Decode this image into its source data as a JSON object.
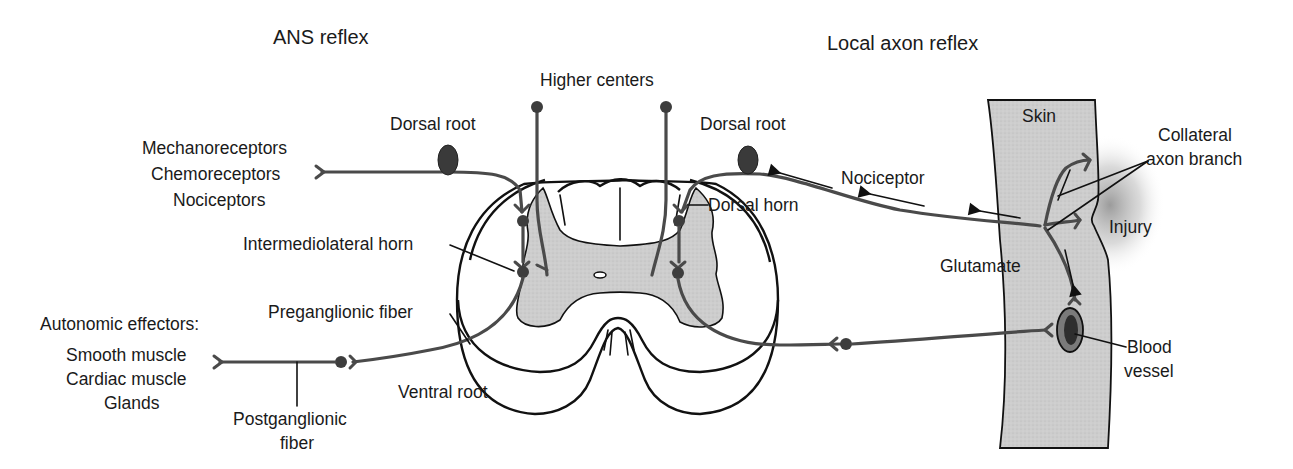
{
  "titles": {
    "ans_reflex": "ANS reflex",
    "local_axon_reflex": "Local axon reflex"
  },
  "labels": {
    "higher_centers": "Higher centers",
    "dorsal_root_left": "Dorsal root",
    "dorsal_root_right": "Dorsal root",
    "receptors": [
      "Mechanoreceptors",
      "Chemoreceptors",
      "Nociceptors"
    ],
    "intermediolateral_horn": "Intermediolateral horn",
    "preganglionic_fiber": "Preganglionic fiber",
    "autonomic_effectors": "Autonomic effectors:",
    "effectors": [
      "Smooth muscle",
      "Cardiac muscle",
      "Glands"
    ],
    "postganglionic_fiber": [
      "Postganglionic",
      "fiber"
    ],
    "ventral_root": "Ventral root",
    "dorsal_horn": "Dorsal horn",
    "nociceptor": "Nociceptor",
    "skin": "Skin",
    "collateral_axon_branch": [
      "Collateral",
      "axon branch"
    ],
    "injury": "Injury",
    "glutamate": "Glutamate",
    "blood_vessel": [
      "Blood",
      "vessel"
    ]
  },
  "colors": {
    "nerve": "#4a4a4a",
    "grey_matter": "#cfcfcf",
    "skin": "#c8c8c8",
    "outline": "#111111",
    "soma": "#3d3d3d"
  }
}
